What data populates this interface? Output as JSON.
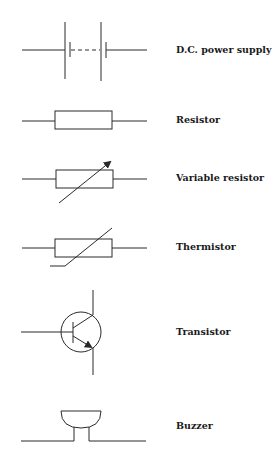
{
  "diagram": {
    "type": "circuit-symbol-legend",
    "stroke_color": "#2a2a2a",
    "background": "#ffffff",
    "symbols": [
      {
        "id": "dc-power-supply",
        "label": "D.C. power supply"
      },
      {
        "id": "resistor",
        "label": "Resistor"
      },
      {
        "id": "variable-resistor",
        "label": "Variable resistor"
      },
      {
        "id": "thermistor",
        "label": "Thermistor"
      },
      {
        "id": "transistor",
        "label": "Transistor"
      },
      {
        "id": "buzzer",
        "label": "Buzzer"
      }
    ]
  }
}
